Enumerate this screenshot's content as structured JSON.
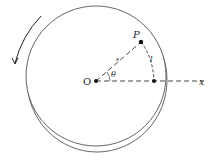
{
  "diagram": {
    "labels": {
      "origin": "O",
      "point": "P",
      "arc_length": "s",
      "chord": "l",
      "angle": "θ",
      "axis": "x"
    },
    "colors": {
      "stroke": "#333333",
      "background": "#ffffff"
    }
  }
}
